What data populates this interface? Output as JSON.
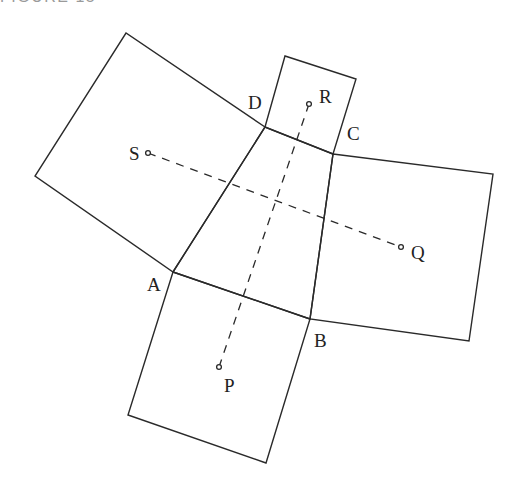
{
  "header": {
    "label": "FIGURE 15"
  },
  "colors": {
    "stroke": "#2a2a2a",
    "header": "#9a9a9a"
  },
  "points": {
    "A": {
      "label": "A",
      "x": 173,
      "y": 272
    },
    "B": {
      "label": "B",
      "x": 310,
      "y": 319
    },
    "C": {
      "label": "C",
      "x": 333,
      "y": 154
    },
    "D": {
      "label": "D",
      "x": 265,
      "y": 127
    },
    "P": {
      "label": "P",
      "x": 219,
      "y": 367
    },
    "Q": {
      "label": "Q",
      "x": 401,
      "y": 247
    },
    "R": {
      "label": "R",
      "x": 309,
      "y": 104
    },
    "S": {
      "label": "S",
      "x": 148,
      "y": 153
    }
  },
  "labels": {
    "A": "A",
    "B": "B",
    "C": "C",
    "D": "D",
    "P": "P",
    "Q": "Q",
    "R": "R",
    "S": "S"
  },
  "squares": [
    {
      "name": "left-square",
      "on_side": "DA",
      "center": "S"
    },
    {
      "name": "top-square",
      "on_side": "DC",
      "center": "R"
    },
    {
      "name": "right-square",
      "on_side": "CB",
      "center": "Q"
    },
    {
      "name": "bottom-square",
      "on_side": "AB",
      "center": "P"
    }
  ],
  "segments": [
    {
      "from": "S",
      "to": "Q",
      "style": "dashed"
    },
    {
      "from": "R",
      "to": "P",
      "style": "dashed"
    }
  ]
}
